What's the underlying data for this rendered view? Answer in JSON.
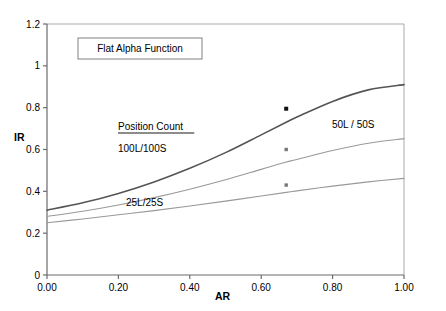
{
  "chart_data": {
    "type": "line",
    "title": "Flat Alpha Function",
    "xlabel": "AR",
    "ylabel": "IR",
    "xlim": [
      0.0,
      1.0
    ],
    "ylim": [
      0.0,
      1.2
    ],
    "grid": false,
    "legend_position": "inline-annotations",
    "legend_heading": "Position Count",
    "x_ticks": [
      "0.00",
      "0.20",
      "0.40",
      "0.60",
      "0.80",
      "1.00"
    ],
    "x_tick_values": [
      0.0,
      0.2,
      0.4,
      0.6,
      0.8,
      1.0
    ],
    "y_ticks": [
      "0",
      "0.2",
      "0.4",
      "0.6",
      "0.8",
      "1",
      "1.2"
    ],
    "y_tick_values": [
      0,
      0.2,
      0.4,
      0.6,
      0.8,
      1.0,
      1.2
    ],
    "x": [
      0.0,
      0.1,
      0.2,
      0.3,
      0.4,
      0.5,
      0.6,
      0.67,
      0.7,
      0.8,
      0.9,
      1.0
    ],
    "series": [
      {
        "name": "100L/100S",
        "color": "#555555",
        "width": 1.6,
        "values": [
          0.31,
          0.345,
          0.39,
          0.445,
          0.51,
          0.585,
          0.67,
          0.73,
          0.755,
          0.83,
          0.885,
          0.91
        ],
        "marker": {
          "x": 0.67,
          "y": 0.795,
          "size": 4,
          "color": "#111111"
        }
      },
      {
        "name": "50L / 50S",
        "color": "#999999",
        "width": 1.1,
        "values": [
          0.28,
          0.305,
          0.335,
          0.37,
          0.41,
          0.455,
          0.505,
          0.54,
          0.552,
          0.595,
          0.63,
          0.652
        ],
        "marker": {
          "x": 0.67,
          "y": 0.6,
          "size": 3.4,
          "color": "#777777"
        }
      },
      {
        "name": "25L/25S",
        "color": "#999999",
        "width": 1.1,
        "values": [
          0.25,
          0.268,
          0.288,
          0.308,
          0.33,
          0.353,
          0.378,
          0.395,
          0.402,
          0.425,
          0.445,
          0.462
        ],
        "marker": {
          "x": 0.67,
          "y": 0.43,
          "size": 3.4,
          "color": "#777777"
        }
      }
    ],
    "annotations": [
      {
        "name": "legend-heading",
        "text": "Position Count",
        "x": 118,
        "y": 130,
        "underline": true
      },
      {
        "name": "label-100l-100s",
        "text": "100L/100S",
        "x": 118,
        "y": 152
      },
      {
        "name": "label-50l-50s",
        "text": "50L / 50S",
        "x": 332,
        "y": 128
      },
      {
        "name": "label-25l-25s",
        "text": "25L/25S",
        "x": 126,
        "y": 206
      }
    ]
  },
  "plot": {
    "left": 47,
    "right": 404,
    "top": 24,
    "bottom": 275,
    "frame_color": "#a9a9a9",
    "axis_color": "#6b6b6b",
    "background": "#ffffff"
  },
  "title_box": {
    "label": "Flat Alpha Function",
    "x": 78,
    "y": 38,
    "width": 124,
    "height": 21,
    "border_color": "#808080"
  },
  "axis_titles": {
    "y": "IR",
    "x": "AR"
  }
}
